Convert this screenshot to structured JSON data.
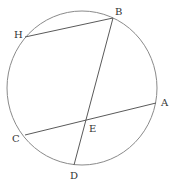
{
  "diagram": {
    "type": "circle-with-chords",
    "circle": {
      "cx": 82,
      "cy": 88,
      "rx": 75,
      "ry": 77,
      "stroke": "#8a8a8a"
    },
    "points": {
      "H": {
        "x": 25,
        "y": 37
      },
      "B": {
        "x": 113,
        "y": 18
      },
      "A": {
        "x": 156,
        "y": 103
      },
      "C": {
        "x": 25,
        "y": 135
      },
      "D": {
        "x": 74,
        "y": 165
      },
      "E": {
        "x": 87,
        "y": 120
      }
    },
    "chords": [
      {
        "name": "HB",
        "from": "H",
        "to": "B"
      },
      {
        "name": "BD",
        "from": "B",
        "to": "D"
      },
      {
        "name": "CA",
        "from": "C",
        "to": "A"
      }
    ],
    "labels": {
      "H": {
        "text": "H",
        "x": 14,
        "y": 38
      },
      "B": {
        "text": "B",
        "x": 115,
        "y": 15
      },
      "A": {
        "text": "A",
        "x": 161,
        "y": 106
      },
      "C": {
        "text": "C",
        "x": 12,
        "y": 142
      },
      "E": {
        "text": "E",
        "x": 89,
        "y": 132
      },
      "D": {
        "text": "D",
        "x": 70,
        "y": 179
      }
    }
  }
}
